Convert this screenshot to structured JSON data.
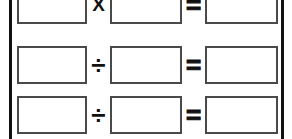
{
  "worksheet": {
    "page_rules": {
      "left_label": "page-margin-rule-left",
      "right_label": "page-margin-rule-right",
      "color": "#111111"
    },
    "box": {
      "value": "",
      "placeholder": "",
      "border_color": "#4a4a4a",
      "fill_color": "#ffffff"
    },
    "rows": [
      {
        "id": "row-1",
        "operand1": "",
        "operator": "X",
        "operator_name": "multiplication",
        "operand2": "",
        "equals": "=",
        "result": ""
      },
      {
        "id": "row-2",
        "operand1": "",
        "operator": "÷",
        "operator_name": "division",
        "operand2": "",
        "equals": "=",
        "result": ""
      },
      {
        "id": "row-3",
        "operand1": "",
        "operator": "÷",
        "operator_name": "division",
        "operand2": "",
        "equals": "=",
        "result": ""
      }
    ]
  }
}
